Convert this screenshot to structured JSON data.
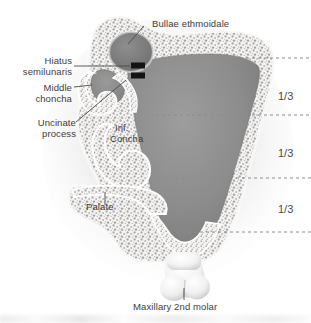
{
  "figure": {
    "background_color": "#ffffff",
    "bone_color": "#f2f1ef",
    "trabecular_speckle_color": "#9a9a9a",
    "sinus_cavity_color": "#8b8b8b",
    "dark_cavity_color": "#7c7c7c",
    "tooth_color": "#fafafa",
    "label_color": "#3d3d3d",
    "leader_line_color": "#4a4a4a",
    "dashed_line_color": "#8c8c8c",
    "marker_color": "#111111"
  },
  "labels": {
    "bullae_ethmoidale": "Bullae ethmoidale",
    "hiatus_semilunaris_line1": "Hiatus",
    "hiatus_semilunaris_line2": "semilunaris",
    "middle_chonchа_line1": "Middle",
    "middle_chonchа_line2": "chonchа",
    "uncinate_process_line1": "Uncinate",
    "uncinate_process_line2": "process",
    "inf_concha_line1": "Inf.",
    "inf_concha_line2": "Concha",
    "palate": "Palate",
    "maxillary_2nd_molar": "Maxillary 2nd molar"
  },
  "measure_ticks": {
    "thirds": [
      "1/3",
      "1/3",
      "1/3"
    ],
    "description": "Maxillary sinus height divided into equal thirds by dashed reference lines"
  }
}
